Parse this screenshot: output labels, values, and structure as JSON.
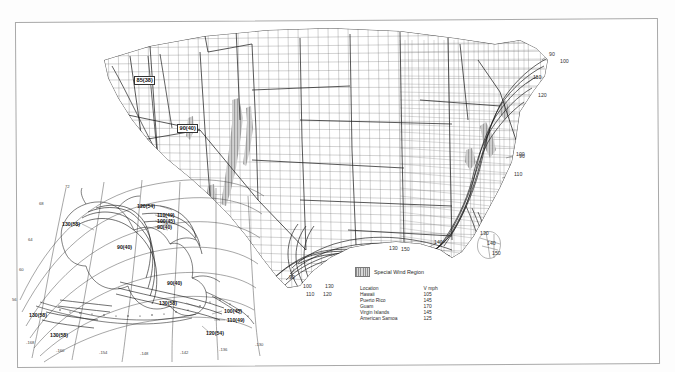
{
  "document": {
    "kind": "basic-wind-speed-map",
    "page_border_color": "#a9a9a9"
  },
  "legend": {
    "swatch_name": "special-wind-region-swatch",
    "label": "Special Wind Region"
  },
  "location_table": {
    "headers": [
      "Location",
      "V mph"
    ],
    "rows": [
      {
        "location": "Hawaii",
        "v": "105"
      },
      {
        "location": "Puerto Rico",
        "v": "145"
      },
      {
        "location": "Guam",
        "v": "170"
      },
      {
        "location": "Virgin Islands",
        "v": "145"
      },
      {
        "location": "American Samoa",
        "v": "125"
      }
    ]
  },
  "mainland": {
    "boxed_labels": [
      {
        "name": "west-coast-85-38",
        "text": "85(38)",
        "x": 134,
        "y": 76
      },
      {
        "name": "west-inland-90-40",
        "text": "90(40)",
        "x": 177,
        "y": 124
      }
    ],
    "contour_labels": [
      {
        "name": "contour-90-northeast",
        "text": "90",
        "x": 549,
        "y": 52
      },
      {
        "name": "contour-100-northeast",
        "text": "100",
        "x": 560,
        "y": 59
      },
      {
        "name": "contour-110-northeast",
        "text": "110",
        "x": 533,
        "y": 75
      },
      {
        "name": "contour-120-northeast",
        "text": "120",
        "x": 538,
        "y": 93
      },
      {
        "name": "contour-90-midatlantic",
        "text": "90",
        "x": 519,
        "y": 154
      },
      {
        "name": "contour-100-carolina",
        "text": "100",
        "x": 516,
        "y": 152
      },
      {
        "name": "contour-110-carolina",
        "text": "110",
        "x": 514,
        "y": 172
      },
      {
        "name": "contour-130-florida",
        "text": "130",
        "x": 480,
        "y": 231
      },
      {
        "name": "contour-140-florida",
        "text": "140",
        "x": 487,
        "y": 241
      },
      {
        "name": "contour-150-florida",
        "text": "150",
        "x": 492,
        "y": 251
      },
      {
        "name": "contour-140-gulf-east",
        "text": "140",
        "x": 434,
        "y": 240
      },
      {
        "name": "contour-130-gulf",
        "text": "130",
        "x": 389,
        "y": 246
      },
      {
        "name": "contour-150-gulf",
        "text": "150",
        "x": 401,
        "y": 247
      },
      {
        "name": "contour-90-texas",
        "text": "90",
        "x": 289,
        "y": 275
      },
      {
        "name": "contour-100-texas",
        "text": "100",
        "x": 303,
        "y": 284
      },
      {
        "name": "contour-110-texas",
        "text": "110",
        "x": 306,
        "y": 292
      },
      {
        "name": "contour-120-texas",
        "text": "120",
        "x": 323,
        "y": 292
      },
      {
        "name": "contour-130-texas",
        "text": "130",
        "x": 325,
        "y": 284
      }
    ]
  },
  "alaska_inset": {
    "labels": [
      {
        "name": "ak-120-54-north",
        "text": "120(54)",
        "x": 137,
        "y": 204
      },
      {
        "name": "ak-110-49-north",
        "text": "110(49)",
        "x": 157,
        "y": 213
      },
      {
        "name": "ak-100-45-north",
        "text": "100(45)",
        "x": 157,
        "y": 219
      },
      {
        "name": "ak-90-40-north",
        "text": "90(40)",
        "x": 157,
        "y": 225
      },
      {
        "name": "ak-130-58-west",
        "text": "130(58)",
        "x": 62,
        "y": 222
      },
      {
        "name": "ak-90-40-interior",
        "text": "90(40)",
        "x": 117,
        "y": 245
      },
      {
        "name": "ak-90-40-south",
        "text": "90(40)",
        "x": 167,
        "y": 281
      },
      {
        "name": "ak-130-58-peninsula",
        "text": "130(58)",
        "x": 159,
        "y": 301
      },
      {
        "name": "ak-100-45-aleutian",
        "text": "100(45)",
        "x": 224,
        "y": 309
      },
      {
        "name": "ak-110-49-aleutian",
        "text": "110(49)",
        "x": 227,
        "y": 318
      },
      {
        "name": "ak-120-54-aleutian",
        "text": "120(54)",
        "x": 206,
        "y": 331
      },
      {
        "name": "ak-130-58-southwest",
        "text": "130(58)",
        "x": 29,
        "y": 313
      },
      {
        "name": "ak-130-58-bottom",
        "text": "130(58)",
        "x": 50,
        "y": 333
      }
    ],
    "lat_ticks": [
      {
        "text": "72",
        "x": 65,
        "y": 185
      },
      {
        "text": "68",
        "x": 39,
        "y": 202
      },
      {
        "text": "64",
        "x": 28,
        "y": 238
      },
      {
        "text": "60",
        "x": 19,
        "y": 268
      },
      {
        "text": "56",
        "x": 12,
        "y": 298
      }
    ],
    "lon_ticks": [
      {
        "text": "-168",
        "x": 26,
        "y": 341
      },
      {
        "text": "-160",
        "x": 56,
        "y": 349
      },
      {
        "text": "-154",
        "x": 99,
        "y": 351
      },
      {
        "text": "-148",
        "x": 140,
        "y": 352
      },
      {
        "text": "-142",
        "x": 180,
        "y": 351
      },
      {
        "text": "-136",
        "x": 219,
        "y": 348
      },
      {
        "text": "-130",
        "x": 255,
        "y": 343
      }
    ]
  }
}
